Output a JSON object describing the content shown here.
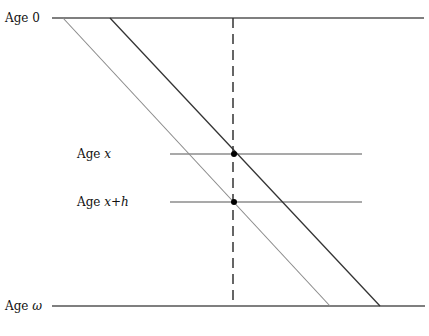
{
  "diagram": {
    "type": "lexis-style age diagram",
    "labels": {
      "age_top": {
        "prefix": "Age ",
        "var": "0"
      },
      "age_x": {
        "prefix": "Age ",
        "var": "x"
      },
      "age_x_h": {
        "prefix": "Age ",
        "var": "x+h"
      },
      "age_bottom": {
        "prefix": "Age ",
        "var": "ω"
      }
    },
    "colors": {
      "line": "#555555",
      "diagonal_light": "#8a8a8a",
      "diagonal_dark": "#333333",
      "dot": "#000000",
      "text": "#111111"
    },
    "lines": {
      "age_0": {
        "x1": 52,
        "y1": 18,
        "x2": 424,
        "y2": 18
      },
      "age_omega": {
        "x1": 52,
        "y1": 306,
        "x2": 425,
        "y2": 306
      },
      "age_x": {
        "x1": 170,
        "y1": 154,
        "x2": 362,
        "y2": 154
      },
      "age_x_h": {
        "x1": 170,
        "y1": 202,
        "x2": 362,
        "y2": 202
      },
      "diagonal_left": {
        "x1": 63,
        "y1": 18,
        "x2": 330,
        "y2": 306
      },
      "diagonal_right": {
        "x1": 110,
        "y1": 18,
        "x2": 380,
        "y2": 306
      },
      "vertical_dashed": {
        "x1": 233,
        "y1": 18,
        "x2": 233,
        "y2": 306
      }
    },
    "points": [
      {
        "name": "point-age-x",
        "cx": 234,
        "cy": 154
      },
      {
        "name": "point-age-x-h",
        "cx": 234,
        "cy": 202
      }
    ]
  }
}
